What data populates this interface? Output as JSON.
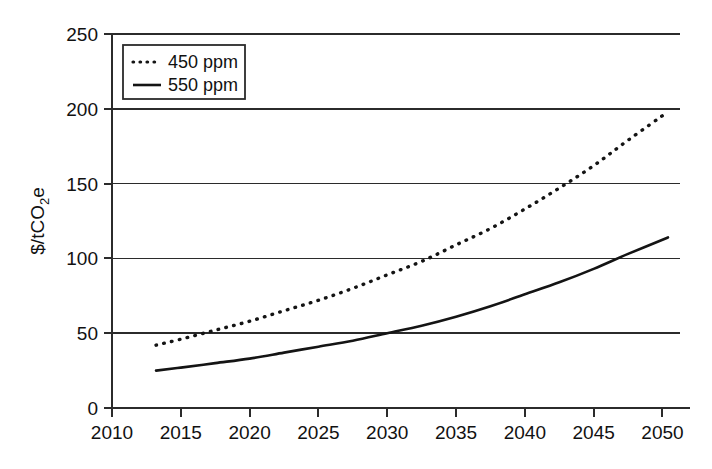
{
  "chart_data": {
    "type": "line",
    "title": "",
    "xlabel": "",
    "ylabel": "$/tCO2e",
    "ylabel_parts": {
      "pre": "$/tCO",
      "sub": "2",
      "post": "e"
    },
    "xlim": [
      2010,
      2052
    ],
    "ylim": [
      0,
      250
    ],
    "grid": "horizontal",
    "legend_position": "top-left",
    "xticks": [
      2010,
      2015,
      2020,
      2025,
      2030,
      2035,
      2040,
      2045,
      2050
    ],
    "xtick_labels": [
      "2010",
      "2015",
      "2020",
      "2025",
      "2030",
      "2035",
      "2040",
      "2045",
      "2050"
    ],
    "yticks": [
      0,
      50,
      100,
      150,
      200,
      250
    ],
    "ytick_labels": [
      "0",
      "50",
      "100",
      "150",
      "200",
      "250"
    ],
    "series": [
      {
        "name": "450 ppm",
        "style": "dotted",
        "color": "#141414",
        "x": [
          2013.2,
          2015,
          2017.5,
          2020,
          2022.5,
          2025,
          2027.5,
          2030,
          2032.5,
          2035,
          2037.5,
          2040,
          2042.5,
          2045,
          2047.5,
          2050.4
        ],
        "values": [
          42,
          46,
          52,
          58,
          65,
          72,
          80,
          89,
          98,
          109,
          120,
          133,
          147,
          162,
          179,
          198
        ]
      },
      {
        "name": "550 ppm",
        "style": "solid",
        "color": "#141414",
        "x": [
          2013.2,
          2015,
          2017.5,
          2020,
          2022.5,
          2025,
          2027.5,
          2030,
          2032.5,
          2035,
          2037.5,
          2040,
          2042.5,
          2045,
          2047.5,
          2050.4
        ],
        "values": [
          25,
          27,
          30,
          33,
          37,
          41,
          45,
          50,
          55,
          61,
          68,
          76,
          84,
          93,
          103,
          114
        ]
      }
    ],
    "legend_entries": [
      {
        "label": "450 ppm",
        "style": "dotted"
      },
      {
        "label": "550 ppm",
        "style": "solid"
      }
    ]
  },
  "colors": {
    "axis": "#2b2b2b",
    "series": "#141414",
    "background": "#ffffff"
  }
}
